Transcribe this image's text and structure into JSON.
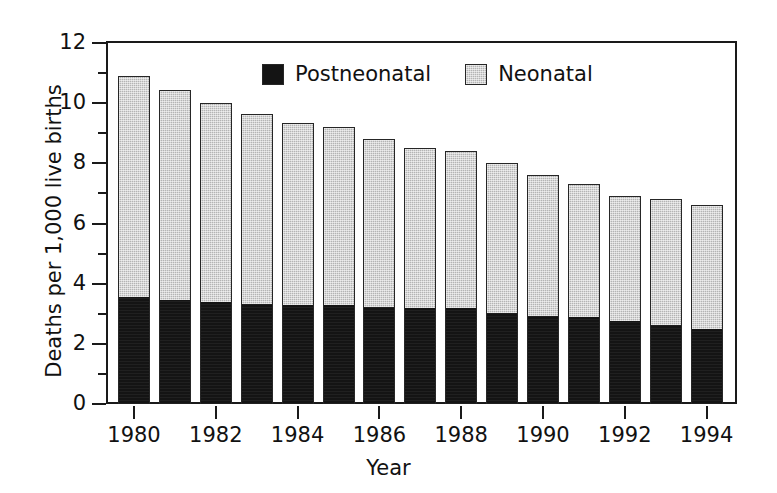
{
  "chart_data": {
    "type": "bar",
    "subtype": "stacked-vertical",
    "title": "",
    "xlabel": "Year",
    "ylabel": "Deaths per 1,000 live births",
    "categories": [
      1980,
      1981,
      1982,
      1983,
      1984,
      1985,
      1986,
      1987,
      1988,
      1989,
      1990,
      1991,
      1992,
      1993,
      1994
    ],
    "x_tick_labels": [
      "1980",
      "1982",
      "1984",
      "1986",
      "1988",
      "1990",
      "1992",
      "1994"
    ],
    "x_tick_values": [
      1980,
      1982,
      1984,
      1986,
      1988,
      1990,
      1992,
      1994
    ],
    "y_tick_labels": [
      "0",
      "2",
      "4",
      "6",
      "8",
      "10",
      "12"
    ],
    "y_tick_values": [
      0,
      2,
      4,
      6,
      8,
      10,
      12
    ],
    "y_minor_tick_values": [
      1,
      3,
      5,
      7,
      9,
      11
    ],
    "ylim": [
      0,
      12
    ],
    "grid": false,
    "legend_position": "top-center-inside",
    "series": [
      {
        "name": "Postneonatal",
        "color": "#141414",
        "values": [
          3.55,
          3.47,
          3.38,
          3.33,
          3.3,
          3.28,
          3.21,
          3.19,
          3.18,
          3.01,
          2.92,
          2.9,
          2.75,
          2.63,
          2.48
        ]
      },
      {
        "name": "Neonatal",
        "color": "#b4b4b4",
        "values": [
          7.35,
          6.96,
          6.63,
          6.3,
          6.04,
          5.94,
          5.61,
          5.32,
          5.24,
          4.99,
          4.69,
          4.42,
          4.18,
          4.18,
          4.14
        ]
      }
    ],
    "totals": [
      10.9,
      10.43,
      10.01,
      9.63,
      9.34,
      9.22,
      8.82,
      8.51,
      8.42,
      8.0,
      7.61,
      7.32,
      6.93,
      6.81,
      6.62
    ]
  },
  "legend": {
    "items": [
      {
        "label": "Postneonatal",
        "swatch": "black-square-swatch"
      },
      {
        "label": "Neonatal",
        "swatch": "gray-square-swatch"
      }
    ]
  },
  "axes": {
    "y_title": "Deaths per 1,000 live births",
    "x_title": "Year"
  }
}
